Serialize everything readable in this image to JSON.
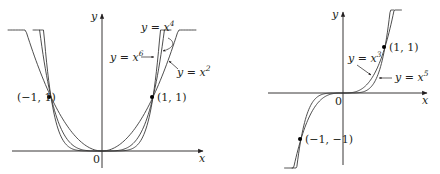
{
  "chart_data": [
    {
      "type": "line",
      "title": "",
      "xlabel": "x",
      "ylabel": "y",
      "origin_label": "0",
      "grid": false,
      "series": [
        {
          "name": "y = x^2",
          "label_base": "y = x",
          "exponent": "2",
          "x": [
            -1.85,
            -1.5,
            -1,
            -0.5,
            0,
            0.5,
            1,
            1.5,
            1.85
          ],
          "values": [
            3.42,
            2.25,
            1,
            0.25,
            0,
            0.25,
            1,
            2.25,
            3.42
          ]
        },
        {
          "name": "y = x^4",
          "label_base": "y = x",
          "exponent": "4",
          "x": [
            -1.36,
            -1,
            -0.5,
            0,
            0.5,
            1,
            1.36
          ],
          "values": [
            3.42,
            1,
            0.0625,
            0,
            0.0625,
            1,
            3.42
          ]
        },
        {
          "name": "y = x^6",
          "label_base": "y = x",
          "exponent": "6",
          "x": [
            -1.23,
            -1,
            -0.5,
            0,
            0.5,
            1,
            1.23
          ],
          "values": [
            3.42,
            1,
            0.0156,
            0,
            0.0156,
            1,
            3.42
          ]
        }
      ],
      "points": [
        {
          "label": "(−1, 1)",
          "x": -1,
          "y": 1
        },
        {
          "label": "(1, 1)",
          "x": 1,
          "y": 1
        }
      ]
    },
    {
      "type": "line",
      "title": "",
      "xlabel": "x",
      "ylabel": "y",
      "origin_label": "0",
      "grid": false,
      "series": [
        {
          "name": "y = x^3",
          "label_base": "y = x",
          "exponent": "3",
          "x": [
            -1.4,
            -1,
            -0.5,
            0,
            0.5,
            1,
            1.4
          ],
          "values": [
            -2.74,
            -1,
            -0.125,
            0,
            0.125,
            1,
            2.74
          ]
        },
        {
          "name": "y = x^5",
          "label_base": "y = x",
          "exponent": "5",
          "x": [
            -1.22,
            -1,
            -0.5,
            0,
            0.5,
            1,
            1.22
          ],
          "values": [
            -2.7,
            -1,
            -0.031,
            0,
            0.031,
            1,
            2.7
          ]
        }
      ],
      "points": [
        {
          "label": "(1, 1)",
          "x": 1,
          "y": 1
        },
        {
          "label": "(−1, −1)",
          "x": -1,
          "y": -1
        }
      ]
    }
  ]
}
